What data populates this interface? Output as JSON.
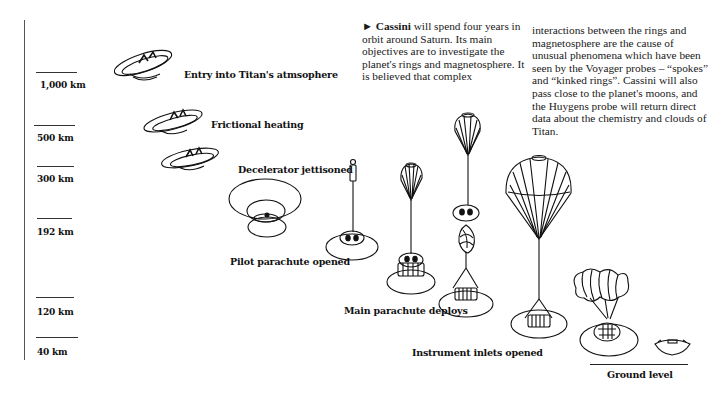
{
  "axis": {
    "ticks": [
      {
        "label": "1,000 km",
        "y": 72
      },
      {
        "label": "500 km",
        "y": 125
      },
      {
        "label": "300 km",
        "y": 166
      },
      {
        "label": "192 km",
        "y": 218
      },
      {
        "label": "120 km",
        "y": 297
      },
      {
        "label": "40 km",
        "y": 337
      }
    ]
  },
  "text": {
    "lead_arrow": "►",
    "lead_bold": "Cassini",
    "col1": " will spend four years in orbit around Saturn. Its main objectives are to investigate the planet's rings and magnetosphere. It is believed that complex",
    "col2": "interactions between the rings and magnetosphere are the cause of unusual phenomena which have been seen by the Voyager probes – “spokes” and “kinked rings”. Cassini will also pass close to the planet's moons, and the Huygens probe will return direct data about the chemistry and clouds of Titan."
  },
  "stages": [
    {
      "label": "Entry into Titan's atmsophere"
    },
    {
      "label": "Frictional heating"
    },
    {
      "label": "Decelerator jettisoned"
    },
    {
      "label": "Pilot parachute opened"
    },
    {
      "label": "Main parachute deploys"
    },
    {
      "label": "Instrument inlets opened"
    },
    {
      "label": "Ground level"
    }
  ]
}
